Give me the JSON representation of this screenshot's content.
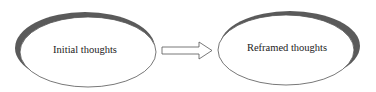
{
  "diagram": {
    "nodes": [
      {
        "id": "initial",
        "label": "Initial thoughts"
      },
      {
        "id": "reframed",
        "label": "Reframed thoughts"
      }
    ],
    "edges": [
      {
        "from": "initial",
        "to": "reframed",
        "style": "hollow-block-arrow"
      }
    ],
    "colors": {
      "outline": "#555555",
      "shadow": "#5a5a5a",
      "fill": "#ffffff"
    }
  }
}
